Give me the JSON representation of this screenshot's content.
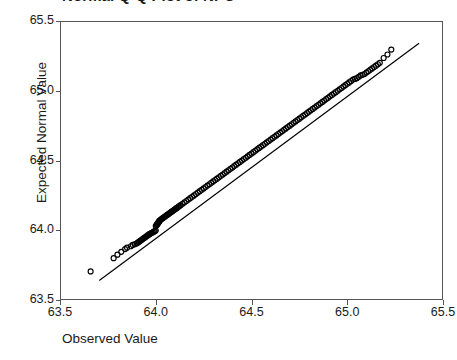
{
  "chart_data": {
    "type": "scatter",
    "title": "Normal Q-Q Plot of NPC",
    "xlabel": "Observed Value",
    "ylabel": "Expected Normal Value",
    "xlim": [
      63.5,
      65.5
    ],
    "ylim": [
      63.5,
      65.5
    ],
    "xticks": [
      "63.5",
      "64.0",
      "64.5",
      "65.0",
      "65.5"
    ],
    "yticks": [
      "65.5",
      "65.0",
      "64.5",
      "64.0",
      "63.5"
    ],
    "xtick_values": [
      63.5,
      64.0,
      64.5,
      65.0,
      65.5
    ],
    "ytick_values": [
      65.5,
      65.0,
      64.5,
      64.0,
      63.5
    ],
    "grid": false,
    "legend": false,
    "marker": "open-circle",
    "marker_color": "#000000",
    "line_color": "#000000",
    "reference_line": {
      "x": [
        63.705,
        65.375
      ],
      "y": [
        63.64,
        65.34
      ]
    },
    "series": [
      {
        "name": "NPC",
        "x": [
          63.66,
          63.78,
          63.8,
          63.82,
          63.84,
          63.85,
          63.87,
          63.88,
          63.89,
          63.9,
          63.905,
          63.91,
          63.915,
          63.92,
          63.925,
          63.93,
          63.935,
          63.94,
          63.945,
          63.95,
          63.955,
          63.96,
          63.965,
          63.97,
          63.975,
          63.98,
          63.985,
          63.99,
          63.995,
          64.0,
          64.0,
          64.005,
          64.005,
          64.01,
          64.01,
          64.015,
          64.015,
          64.02,
          64.02,
          64.025,
          64.03,
          64.035,
          64.04,
          64.045,
          64.05,
          64.055,
          64.06,
          64.065,
          64.07,
          64.075,
          64.08,
          64.085,
          64.09,
          64.095,
          64.1,
          64.105,
          64.11,
          64.115,
          64.12,
          64.125,
          64.13,
          64.14,
          64.15,
          64.16,
          64.17,
          64.18,
          64.19,
          64.2,
          64.21,
          64.22,
          64.23,
          64.24,
          64.25,
          64.26,
          64.27,
          64.28,
          64.29,
          64.3,
          64.31,
          64.32,
          64.33,
          64.34,
          64.35,
          64.36,
          64.37,
          64.38,
          64.39,
          64.4,
          64.41,
          64.42,
          64.43,
          64.44,
          64.45,
          64.46,
          64.47,
          64.48,
          64.49,
          64.5,
          64.51,
          64.52,
          64.53,
          64.54,
          64.55,
          64.56,
          64.57,
          64.58,
          64.59,
          64.6,
          64.61,
          64.62,
          64.63,
          64.64,
          64.65,
          64.66,
          64.67,
          64.68,
          64.69,
          64.7,
          64.71,
          64.72,
          64.73,
          64.74,
          64.75,
          64.76,
          64.77,
          64.78,
          64.79,
          64.8,
          64.81,
          64.82,
          64.83,
          64.84,
          64.85,
          64.86,
          64.87,
          64.88,
          64.89,
          64.9,
          64.91,
          64.92,
          64.93,
          64.94,
          64.95,
          64.96,
          64.97,
          64.98,
          64.99,
          65.0,
          65.01,
          65.02,
          65.03,
          65.04,
          65.05,
          65.06,
          65.07,
          65.08,
          65.09,
          65.1,
          65.11,
          65.12,
          65.13,
          65.14,
          65.15,
          65.16,
          65.17,
          65.19,
          65.21,
          65.23
        ],
        "y": [
          63.705,
          63.8,
          63.825,
          63.845,
          63.865,
          63.875,
          63.885,
          63.895,
          63.9,
          63.905,
          63.91,
          63.915,
          63.92,
          63.925,
          63.93,
          63.935,
          63.94,
          63.945,
          63.95,
          63.955,
          63.96,
          63.965,
          63.97,
          63.975,
          63.978,
          63.982,
          63.986,
          63.99,
          63.994,
          63.998,
          64.03,
          64.035,
          64.04,
          64.045,
          64.05,
          64.055,
          64.06,
          64.065,
          64.07,
          64.075,
          64.08,
          64.085,
          64.09,
          64.095,
          64.1,
          64.105,
          64.11,
          64.115,
          64.12,
          64.125,
          64.13,
          64.135,
          64.14,
          64.145,
          64.15,
          64.155,
          64.16,
          64.165,
          64.17,
          64.175,
          64.18,
          64.19,
          64.2,
          64.21,
          64.22,
          64.23,
          64.24,
          64.25,
          64.26,
          64.27,
          64.28,
          64.29,
          64.3,
          64.31,
          64.32,
          64.33,
          64.34,
          64.35,
          64.36,
          64.37,
          64.38,
          64.39,
          64.4,
          64.41,
          64.42,
          64.43,
          64.44,
          64.45,
          64.46,
          64.47,
          64.48,
          64.49,
          64.5,
          64.51,
          64.52,
          64.53,
          64.54,
          64.55,
          64.56,
          64.57,
          64.58,
          64.59,
          64.6,
          64.61,
          64.62,
          64.63,
          64.64,
          64.65,
          64.66,
          64.67,
          64.68,
          64.69,
          64.7,
          64.71,
          64.72,
          64.73,
          64.74,
          64.75,
          64.76,
          64.77,
          64.78,
          64.79,
          64.8,
          64.81,
          64.82,
          64.83,
          64.84,
          64.85,
          64.86,
          64.87,
          64.88,
          64.89,
          64.9,
          64.91,
          64.92,
          64.93,
          64.94,
          64.95,
          64.96,
          64.97,
          64.98,
          64.99,
          65.0,
          65.01,
          65.02,
          65.03,
          65.04,
          65.05,
          65.06,
          65.07,
          65.08,
          65.085,
          65.09,
          65.1,
          65.11,
          65.115,
          65.12,
          65.13,
          65.14,
          65.15,
          65.16,
          65.17,
          65.18,
          65.19,
          65.2,
          65.235,
          65.26,
          65.295
        ]
      }
    ]
  }
}
